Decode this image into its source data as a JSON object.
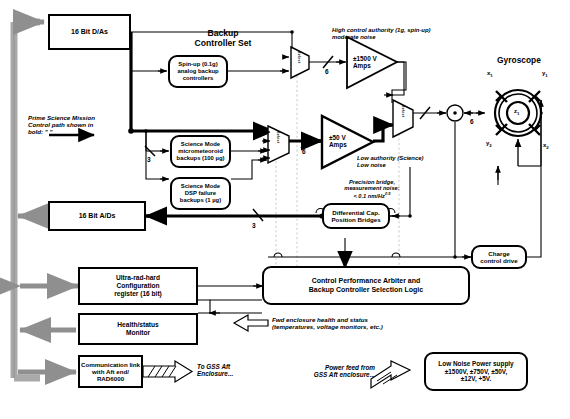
{
  "diagram": {
    "boxes": {
      "dac": "16 Bit D/As",
      "adc": "16 Bit A/Ds",
      "backup_set_title": "Backup\nController Set",
      "spinup": "Spin-up (0.1g)\nanalog backup\ncontrollers",
      "micrometeoroid": "Science Mode\nmicrometeoroid\nbackups (100 µg)",
      "dsp_failure": "Science Mode\nDSP failure\nbackups (1 µg)",
      "hv_amps": "±1500 V\nAmps",
      "lv_amps": "±50 V\nAmps",
      "bridges": "Differential Cap.\nPosition Bridges",
      "arbiter": "Control Performance Arbiter and\nBackup Controller Selection Logic",
      "charge_drive": "Charge\ncontrol drive",
      "config_reg": "Ultra-rad-hard\nConfiguration\nregister (16 bit)",
      "health_monitor": "Health/status\nMonitor",
      "comm_link": "Communication link\nwith Aft end/\nRAD6000",
      "power_supply": "Low Noise Power supply\n±1500V, ±750V, ±50V,\n±12V, +5V."
    },
    "annotations": {
      "prime_path": "Prime Science Mission\nControl path shown in\nbold: \"           \"",
      "high_authority": "High control authority (1g, spin-up)\nmoderate noise",
      "low_authority": "Low authority (Science)\nLow noise",
      "precision_bridge": "Precision bridge,\nmeasurement noise:\n< 0.1 nm/Hz",
      "precision_bridge_exp": "0.5",
      "fwd_enclosure": "Fwd enclosure health and status\n(temperatures, voltage monitors, etc.)",
      "to_gss": "To GSS Aft\nEnclosure...",
      "power_feed": "Power feed from\nGSS Aft enclosure...",
      "gyroscope_title": "Gyroscope"
    },
    "mux_labels": {
      "mux_top": "Select",
      "mux_mid": "Select",
      "mux_out": "Select"
    },
    "bus_counts": {
      "spinup_in": "3",
      "hv_out": "6",
      "lv_out": "6",
      "gyro": "6",
      "adc_in": "3"
    },
    "gyroscope": {
      "electrode_top_left": "x",
      "electrode_top_left_sub": "1",
      "electrode_top_right": "y",
      "electrode_top_right_sub": "1",
      "electrode_bottom_left": "y",
      "electrode_bottom_left_sub": "2",
      "electrode_bottom_right": "x",
      "electrode_bottom_right_sub": "2",
      "rotor": "z",
      "rotor_sub": "1"
    },
    "colors": {
      "line": "#000000",
      "bus_gray": "#a8a8a8",
      "dashed_gray": "#c9c9c9",
      "background": "#ffffff"
    }
  }
}
